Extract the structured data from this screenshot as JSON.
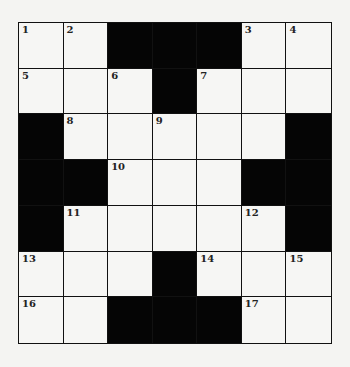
{
  "puzzle": {
    "rows": 7,
    "cols": 7,
    "grid": [
      [
        {
          "n": "1"
        },
        {
          "n": "2"
        },
        {
          "b": 1
        },
        {
          "b": 1
        },
        {
          "b": 1
        },
        {
          "n": "3"
        },
        {
          "n": "4"
        }
      ],
      [
        {
          "n": "5"
        },
        {},
        {
          "n": "6"
        },
        {
          "b": 1
        },
        {
          "n": "7"
        },
        {},
        {}
      ],
      [
        {
          "b": 1
        },
        {
          "n": "8"
        },
        {},
        {
          "n": "9"
        },
        {},
        {},
        {
          "b": 1
        }
      ],
      [
        {
          "b": 1
        },
        {
          "b": 1
        },
        {
          "n": "10"
        },
        {},
        {},
        {
          "b": 1
        },
        {
          "b": 1
        }
      ],
      [
        {
          "b": 1
        },
        {
          "n": "11"
        },
        {},
        {},
        {},
        {
          "n": "12"
        },
        {
          "b": 1
        }
      ],
      [
        {
          "n": "13"
        },
        {},
        {},
        {
          "b": 1
        },
        {
          "n": "14"
        },
        {},
        {
          "n": "15"
        }
      ],
      [
        {
          "n": "16"
        },
        {},
        {
          "b": 1
        },
        {
          "b": 1
        },
        {
          "b": 1
        },
        {
          "n": "17"
        },
        {}
      ]
    ]
  },
  "colors": {
    "block": "#050505",
    "cell": "#f6f6f4",
    "line": "#111111"
  }
}
